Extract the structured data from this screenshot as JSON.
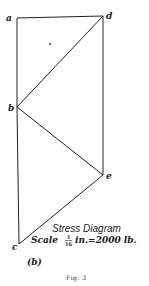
{
  "diagram": {
    "points": {
      "a": {
        "label": "a",
        "x": 17,
        "y": 18
      },
      "d": {
        "label": "d",
        "x": 103,
        "y": 16
      },
      "b": {
        "label": "b",
        "x": 17,
        "y": 107
      },
      "e": {
        "label": "e",
        "x": 103,
        "y": 175
      },
      "c": {
        "label": "c",
        "x": 19,
        "y": 244
      }
    },
    "edges": [
      [
        "a",
        "d"
      ],
      [
        "a",
        "b"
      ],
      [
        "b",
        "c"
      ],
      [
        "d",
        "e"
      ],
      [
        "b",
        "d"
      ],
      [
        "b",
        "e"
      ],
      [
        "c",
        "e"
      ]
    ],
    "dot": {
      "x": 50,
      "y": 44
    },
    "title": "Stress Diagram",
    "scale": {
      "prefix": "Scale",
      "fraction_num": "1",
      "fraction_den": "16",
      "suffix": "in.=2000 lb."
    },
    "sublabel": "(b)",
    "caption": "Fig. 3",
    "colors": {
      "ink": "#222222",
      "background": "#ffffff"
    }
  }
}
